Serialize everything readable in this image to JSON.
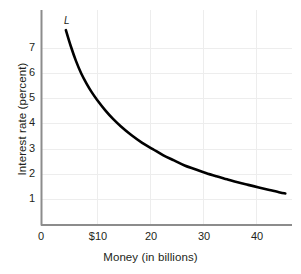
{
  "chart_data": {
    "type": "line",
    "title": "",
    "xlabel": "Money (in billions)",
    "ylabel": "Interest rate (percent)",
    "xlim": [
      0,
      47.5
    ],
    "ylim": [
      0,
      8.6
    ],
    "grid": true,
    "legend": "none",
    "xticks": [
      {
        "value": 0,
        "label": "0"
      },
      {
        "value": 10,
        "label": "$10"
      },
      {
        "value": 20,
        "label": "20"
      },
      {
        "value": 30,
        "label": "30"
      },
      {
        "value": 40,
        "label": "40"
      }
    ],
    "yticks": [
      {
        "value": 7,
        "label": "7"
      },
      {
        "value": 6,
        "label": "6"
      },
      {
        "value": 5,
        "label": "5"
      },
      {
        "value": 4,
        "label": "4"
      },
      {
        "value": 3,
        "label": "3"
      },
      {
        "value": 2,
        "label": "2"
      },
      {
        "value": 1,
        "label": "1"
      }
    ],
    "series": [
      {
        "name": "L",
        "annotation": "L",
        "color": "#000000",
        "x": [
          4.6,
          5.5,
          6.5,
          7.5,
          8.5,
          9.5,
          10.5,
          12,
          13.5,
          15,
          17,
          19,
          21,
          23,
          25,
          27,
          29,
          31,
          33,
          35,
          37,
          39,
          41,
          43,
          45,
          46
        ],
        "y": [
          7.72,
          7.1,
          6.5,
          6.0,
          5.6,
          5.25,
          4.95,
          4.55,
          4.2,
          3.9,
          3.55,
          3.25,
          3.0,
          2.75,
          2.55,
          2.35,
          2.2,
          2.05,
          1.92,
          1.8,
          1.68,
          1.58,
          1.48,
          1.38,
          1.28,
          1.24
        ]
      }
    ]
  },
  "axis_colors": {
    "axis_line": "#808080",
    "gridline": "#ededed",
    "curve": "#000000",
    "text": "#231f20"
  }
}
